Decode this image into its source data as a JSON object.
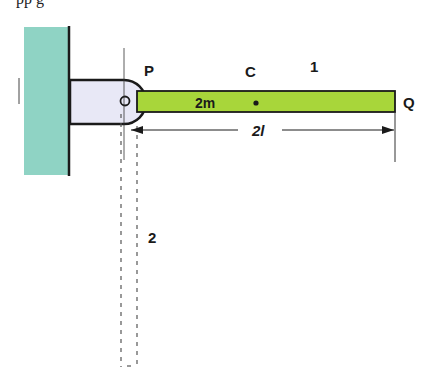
{
  "top_text": "pp g",
  "labels": {
    "pivot_point": "P",
    "center_of_mass": "C",
    "rod_number": "1",
    "free_end": "Q",
    "mass": "2m",
    "length": "2l",
    "final_position_number": "2"
  },
  "colors": {
    "wall": "#8fd3c4",
    "bracket": "#e8e8f6",
    "rod": "#a8d63a",
    "outline": "#1a1a1a",
    "dashed": "#555555"
  }
}
